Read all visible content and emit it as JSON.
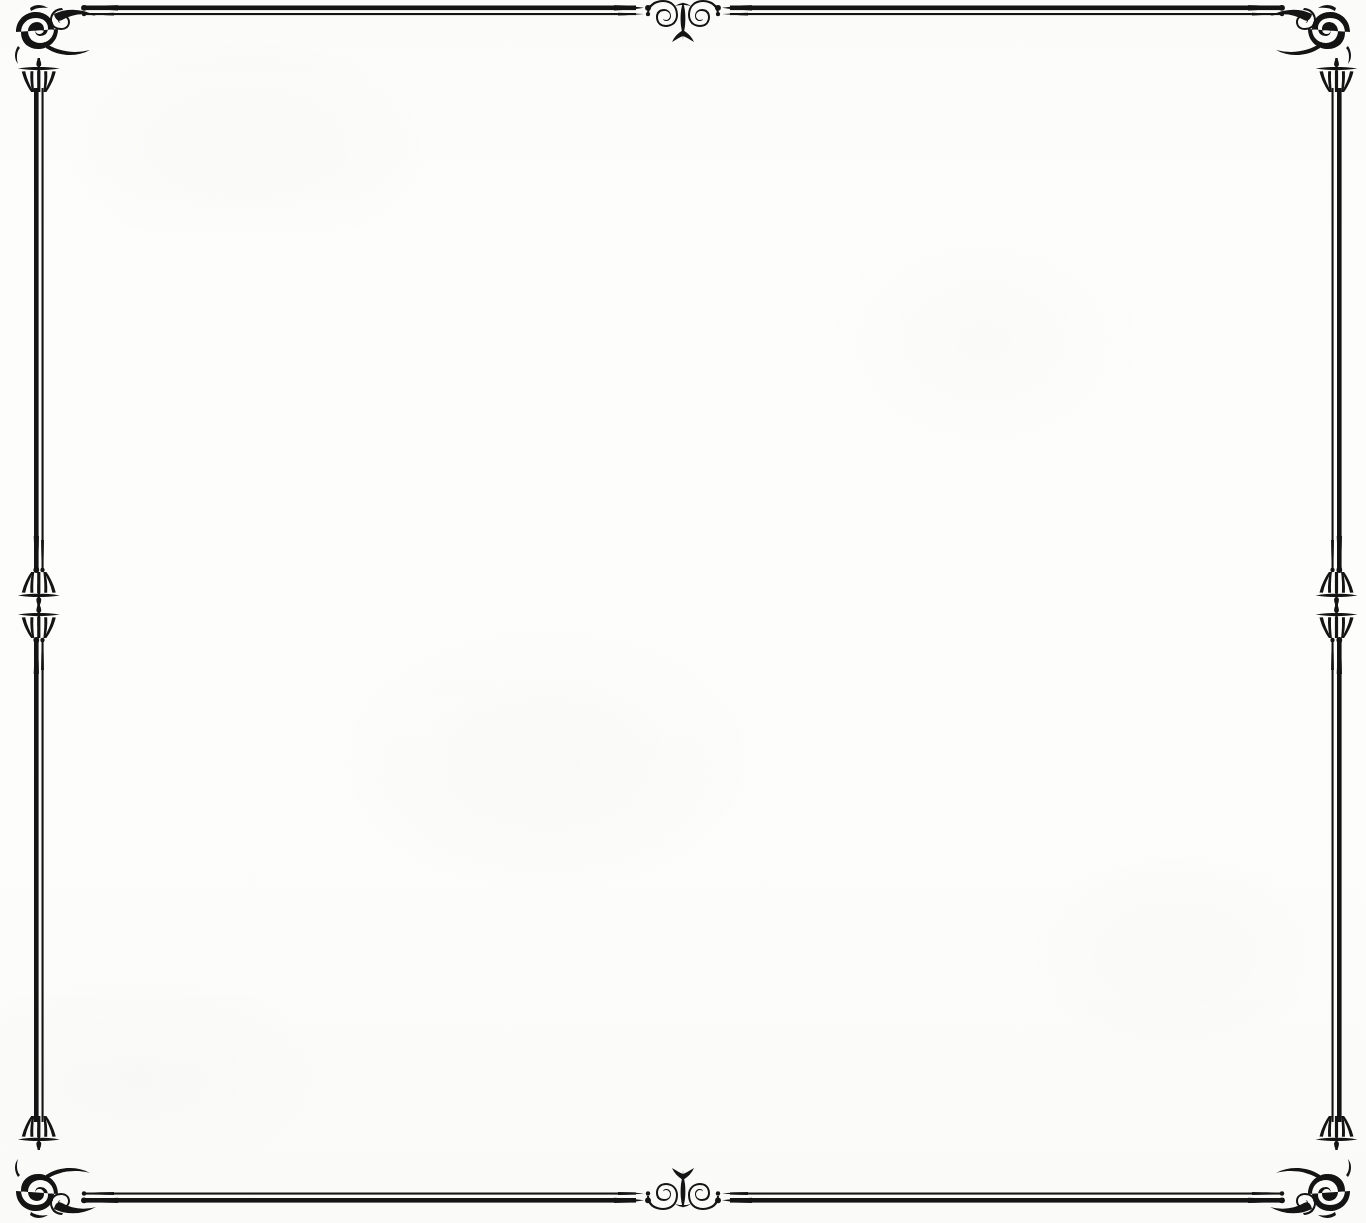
{
  "document": {
    "kind": "scanned-ornamental-page-border",
    "page_title": "",
    "body_text": "",
    "background_color": "#fdfdfc",
    "ink_color": "#141414",
    "page_width": 1366,
    "page_height": 1223
  },
  "frame": {
    "name": "decorative-double-rule-border",
    "rule_style": "double",
    "thick_rule_width_px": 5,
    "thin_rule_width_px": 2,
    "rule_color": "#141414",
    "inset": {
      "left": 36,
      "top": 6,
      "right": 1340,
      "bottom": 1203
    },
    "terminals": "tapered-dart-with-dot",
    "ornaments": [
      {
        "id": "corner-top-left",
        "type": "swirl-fleuron-corner",
        "position": "top-left",
        "rotation_deg": 0
      },
      {
        "id": "corner-top-right",
        "type": "swirl-fleuron-corner",
        "position": "top-right",
        "rotation_deg": 0
      },
      {
        "id": "corner-bottom-left",
        "type": "swirl-fleuron-corner",
        "position": "bottom-left",
        "rotation_deg": 0
      },
      {
        "id": "corner-bottom-right",
        "type": "swirl-fleuron-corner",
        "position": "bottom-right",
        "rotation_deg": 0
      },
      {
        "id": "midpoint-top",
        "type": "double-swirl-fleuron",
        "position": "top-center",
        "rotation_deg": 0
      },
      {
        "id": "midpoint-bottom",
        "type": "double-swirl-fleuron",
        "position": "bottom-center",
        "rotation_deg": 180
      },
      {
        "id": "midpoint-left",
        "type": "double-swirl-fleuron",
        "position": "left-middle",
        "rotation_deg": 90
      },
      {
        "id": "midpoint-right",
        "type": "double-swirl-fleuron",
        "position": "right-middle",
        "rotation_deg": 270
      }
    ],
    "caps": {
      "type": "fleur-cap-with-crossbar",
      "count": 8,
      "description": "flared cap with horizontal cross-bar at each rule start"
    }
  }
}
